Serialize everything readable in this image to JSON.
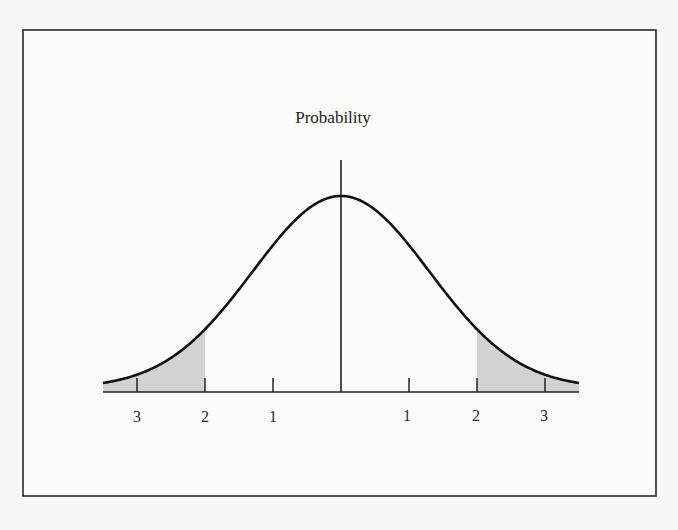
{
  "chart_data": {
    "type": "area",
    "title": "",
    "ylabel": "Probability",
    "xlabel": "",
    "x_ticks": [
      -3,
      -2,
      -1,
      0,
      1,
      2,
      3
    ],
    "x_tick_labels": [
      "3",
      "2",
      "1",
      "",
      "1",
      "2",
      "3"
    ],
    "xlim": [
      -3.5,
      3.5
    ],
    "ylim": [
      0,
      1
    ],
    "grid": false,
    "legend": null,
    "curve": {
      "name": "Probability density",
      "distribution": "normal",
      "mean": 0,
      "peak_relative_height": 1.0,
      "x": [
        -3.5,
        -3,
        -2.5,
        -2,
        -1.5,
        -1,
        -0.5,
        0,
        0.5,
        1,
        1.5,
        2,
        2.5,
        3,
        3.5
      ],
      "values": [
        0.06,
        0.1,
        0.18,
        0.31,
        0.49,
        0.73,
        0.92,
        1.0,
        0.92,
        0.73,
        0.49,
        0.31,
        0.18,
        0.1,
        0.06
      ]
    },
    "shaded_regions": [
      {
        "from": -3.5,
        "to": -2,
        "color": "#d2d2d2"
      },
      {
        "from": 2,
        "to": 3.5,
        "color": "#d2d2d2"
      }
    ],
    "colors": {
      "curve": "#111111",
      "shade": "#d2d2d2",
      "axis": "#222222",
      "frame": "#2a2a2a"
    }
  },
  "labels": {
    "y_axis_title": "Probability",
    "ticks": [
      "3",
      "2",
      "1",
      "1",
      "2",
      "3"
    ]
  }
}
